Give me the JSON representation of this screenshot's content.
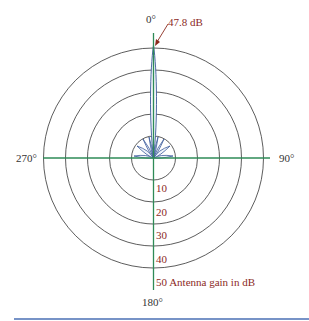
{
  "diagram": {
    "angle_labels": {
      "top": "0°",
      "right": "90°",
      "bottom": "180°",
      "left": "270°"
    },
    "peak_annotation": "47.8 dB",
    "ring_labels": [
      "10",
      "20",
      "30",
      "40",
      "50 Antenna gain in dB"
    ],
    "ring_values_db": [
      10,
      20,
      30,
      40,
      50
    ],
    "colors": {
      "axis": "#2e8b57",
      "rings": "#333333",
      "pattern": "#3b5a9a",
      "annotation": "#8b2a1e",
      "divider": "#4a6fb5"
    }
  }
}
